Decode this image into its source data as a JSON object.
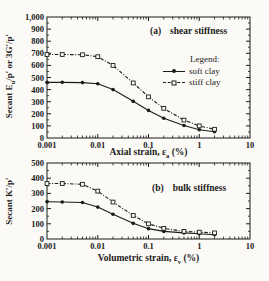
{
  "figure": {
    "background": "#fbfaf6",
    "ink": "#1b1b1b"
  },
  "chart_data": [
    {
      "type": "line",
      "panel_label": "(a)",
      "title": "shear stiffness",
      "ylabel_pre": "Secant  E",
      "ylabel_sub": "u",
      "ylabel_post": "/p′ or 3G′/p′",
      "xlabel_pre": "Axial strain, ε",
      "xlabel_sub": "a",
      "xlabel_post": " (%)",
      "xscale": "log",
      "xlim": [
        0.001,
        10
      ],
      "ylim": [
        0,
        1000
      ],
      "xtick_values": [
        0.001,
        0.01,
        0.1,
        1,
        10
      ],
      "xtick_labels": [
        "0.001",
        "0.01",
        "0.1",
        "1",
        "10"
      ],
      "ytick_step": 100,
      "ytick_labels": [
        "0",
        "100",
        "200",
        "300",
        "400",
        "500",
        "600",
        "700",
        "800",
        "900",
        "1,000"
      ],
      "grid": false,
      "legend": {
        "title": "Legend:",
        "position": "inside-right",
        "entries": [
          {
            "name": "soft clay",
            "line": "solid",
            "marker": "filled-circle"
          },
          {
            "name": "stiff clay",
            "line": "dash-dot",
            "marker": "open-square"
          }
        ]
      },
      "x": [
        0.001,
        0.002,
        0.005,
        0.01,
        0.02,
        0.05,
        0.1,
        0.2,
        0.5,
        1,
        2
      ],
      "series": [
        {
          "name": "soft clay",
          "line": "solid",
          "marker": "filled-circle",
          "values": [
            460,
            460,
            458,
            448,
            400,
            303,
            228,
            163,
            103,
            68,
            52
          ]
        },
        {
          "name": "stiff clay",
          "line": "dash-dot",
          "marker": "open-square",
          "values": [
            690,
            690,
            688,
            672,
            600,
            455,
            340,
            245,
            148,
            100,
            72
          ]
        }
      ]
    },
    {
      "type": "line",
      "panel_label": "(b)",
      "title": "bulk stiffness",
      "ylabel_pre": "Secant  K",
      "ylabel_sub": "",
      "ylabel_post": "′/p′",
      "xlabel_pre": "Volumetric strain, ε",
      "xlabel_sub": "v",
      "xlabel_post": " (%)",
      "xscale": "log",
      "xlim": [
        0.001,
        10
      ],
      "ylim": [
        0,
        500
      ],
      "xtick_values": [
        0.001,
        0.01,
        0.1,
        1,
        10
      ],
      "xtick_labels": [
        "0.001",
        "0.01",
        "0.1",
        "1",
        "10"
      ],
      "ytick_step": 100,
      "ytick_labels": [
        "0",
        "100",
        "200",
        "300",
        "400",
        "500"
      ],
      "grid": false,
      "x": [
        0.001,
        0.002,
        0.005,
        0.01,
        0.02,
        0.05,
        0.1,
        0.2,
        0.5,
        1,
        2
      ],
      "series": [
        {
          "name": "soft clay",
          "line": "solid",
          "marker": "filled-circle",
          "values": [
            245,
            243,
            240,
            210,
            163,
            103,
            68,
            50,
            40,
            35,
            28
          ]
        },
        {
          "name": "stiff clay",
          "line": "dash-dot",
          "marker": "open-square",
          "values": [
            365,
            365,
            360,
            315,
            243,
            155,
            100,
            70,
            50,
            45,
            40
          ]
        }
      ]
    }
  ]
}
